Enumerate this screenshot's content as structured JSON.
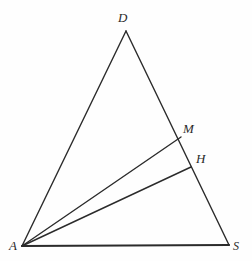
{
  "figure": {
    "type": "euclidean-geometry-diagram",
    "background_color": "#fefefe",
    "stroke_color": "#2b2b2b",
    "label_color": "#2b2b2b",
    "points": [
      {
        "name": "D",
        "label": "D",
        "x": 126,
        "y": 31,
        "label_x": 118,
        "label_y": 11
      },
      {
        "name": "M",
        "label": "M",
        "x": 181,
        "y": 137,
        "label_x": 183,
        "label_y": 122
      },
      {
        "name": "H",
        "label": "H",
        "x": 191,
        "y": 167,
        "label_x": 196,
        "label_y": 152
      },
      {
        "name": "A",
        "label": "A",
        "x": 22,
        "y": 246,
        "label_x": 9,
        "label_y": 239
      },
      {
        "name": "S",
        "label": "S",
        "x": 229,
        "y": 245,
        "label_x": 233,
        "label_y": 240
      }
    ],
    "segments": [
      {
        "name": "side-AD",
        "from": "A",
        "to": "D",
        "width": 1.4
      },
      {
        "name": "side-DS",
        "from": "D",
        "to": "S",
        "width": 1.4
      },
      {
        "name": "side-AS",
        "from": "A",
        "to": "S",
        "width": 2.2
      },
      {
        "name": "cevian-AM",
        "from": "A",
        "to": "M",
        "width": 1.4
      },
      {
        "name": "cevian-AH",
        "from": "A",
        "to": "H",
        "width": 1.4
      }
    ]
  }
}
